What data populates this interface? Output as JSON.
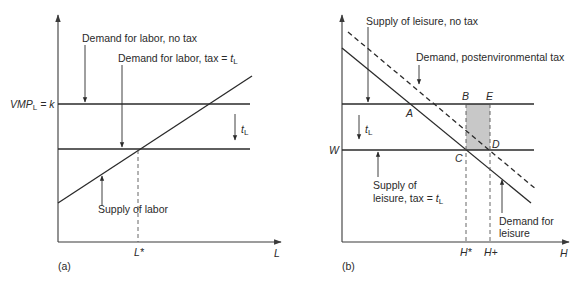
{
  "colors": {
    "line": "#2a2a2a",
    "axis": "#3a3a3a",
    "shade": "#c8c8c8",
    "background": "#ffffff"
  },
  "panel_a": {
    "tag": "(a)",
    "x_axis_label": "L",
    "y_tick_label_main": "VMP",
    "y_tick_label_sub": "L",
    "y_tick_label_rest": " = k",
    "x_tick_label": "L*",
    "labels": {
      "demand_no_tax": "Demand for labor, no tax",
      "demand_tax_prefix": "Demand for labor, tax = ",
      "demand_tax_var": "t",
      "demand_tax_sub": "L",
      "tax_shift_var": "t",
      "tax_shift_sub": "L",
      "supply": "Supply of labor"
    }
  },
  "panel_b": {
    "tag": "(b)",
    "x_axis_label": "H",
    "y_tick_label": "W",
    "x_tick_labels": [
      "H*",
      "H+"
    ],
    "points": [
      "A",
      "B",
      "C",
      "D",
      "E"
    ],
    "labels": {
      "supply_no_tax": "Supply of leisure, no tax",
      "demand_post_tax": "Demand, postenvironmental tax",
      "tax_shift_var": "t",
      "tax_shift_sub": "L",
      "supply_tax_line1": "Supply of",
      "supply_tax_line2_prefix": "leisure, tax = ",
      "supply_tax_var": "t",
      "supply_tax_sub": "L",
      "demand_leisure_line1": "Demand for",
      "demand_leisure_line2": "leisure"
    }
  }
}
